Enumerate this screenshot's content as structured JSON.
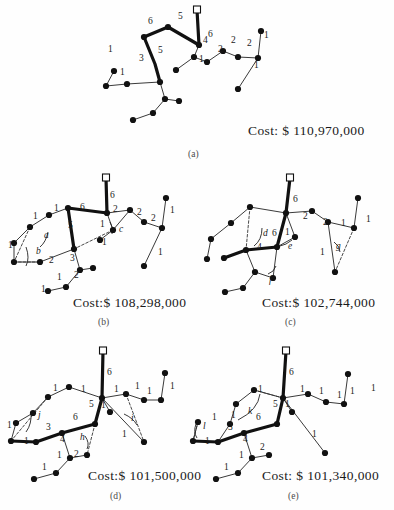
{
  "figure": {
    "panels": [
      {
        "id": "a",
        "caption": "(a)",
        "cost_label": "Cost: $ 110,970,000",
        "cost_value": 110970000,
        "cost_currency": "$",
        "cost_prefix": "Cost:",
        "root_marker": "square-terminal",
        "edge_labels": [
          "6",
          "5",
          "6",
          "5",
          "3",
          "1",
          "1",
          "4",
          "1",
          "2",
          "2",
          "2",
          "1",
          "1"
        ],
        "node_count": 20,
        "greek_labels": []
      },
      {
        "id": "b",
        "caption": "(b)",
        "cost_label": "Cost:$ 108,298,000",
        "cost_value": 108298000,
        "cost_currency": "$",
        "cost_prefix": "Cost:",
        "root_marker": "square-terminal",
        "edge_labels": [
          "6",
          "6",
          "1",
          "5",
          "1",
          "1",
          "2",
          "3",
          "1",
          "2",
          "1",
          "2",
          "1",
          "2",
          "2",
          "1",
          "1"
        ],
        "greek_labels": [
          "a",
          "b",
          "c"
        ]
      },
      {
        "id": "c",
        "caption": "(c)",
        "cost_label": "Cost:$ 102,744,000",
        "cost_value": 102744000,
        "cost_currency": "$",
        "cost_prefix": "Cost:",
        "root_marker": "square-terminal",
        "edge_labels": [
          "6",
          "2",
          "6",
          "1",
          "4",
          "2",
          "1",
          "1",
          "1"
        ],
        "greek_labels": [
          "d",
          "e",
          "f",
          "g"
        ]
      },
      {
        "id": "d",
        "caption": "(d)",
        "cost_label": "Cost:$ 101,500,000",
        "cost_value": 101500000,
        "cost_currency": "$",
        "cost_prefix": "Cost:",
        "root_marker": "square-terminal",
        "edge_labels": [
          "6",
          "1",
          "1",
          "1",
          "1",
          "1",
          "5",
          "1",
          "6",
          "3",
          "4",
          "2",
          "1",
          "1",
          "1",
          "1",
          "1"
        ],
        "greek_labels": [
          "h",
          "i",
          "j"
        ]
      },
      {
        "id": "e",
        "caption": "(e)",
        "cost_label": "Cost: $ 101,340,000",
        "cost_value": 101340000,
        "cost_currency": "$",
        "cost_prefix": "Cost:",
        "root_marker": "square-terminal",
        "edge_labels": [
          "6",
          "1",
          "1",
          "1",
          "1",
          "5",
          "1",
          "6",
          "1",
          "3",
          "1",
          "4",
          "2",
          "1",
          "1",
          "1"
        ],
        "greek_labels": [
          "k",
          "l"
        ]
      }
    ]
  },
  "panel_a": {
    "caption": "(a)",
    "cost": "Cost: $ 110,970,000",
    "labels": [
      {
        "t": "6",
        "x": 208,
        "y": 37
      },
      {
        "t": "5",
        "x": 178,
        "y": 19
      },
      {
        "t": "6",
        "x": 148,
        "y": 24
      },
      {
        "t": "5",
        "x": 158,
        "y": 53
      },
      {
        "t": "3",
        "x": 139,
        "y": 61
      },
      {
        "t": "1",
        "x": 108,
        "y": 52
      },
      {
        "t": "1",
        "x": 120,
        "y": 75
      },
      {
        "t": "4",
        "x": 203,
        "y": 43
      },
      {
        "t": "1",
        "x": 199,
        "y": 62
      },
      {
        "t": "2",
        "x": 218,
        "y": 52
      },
      {
        "t": "2",
        "x": 231,
        "y": 43
      },
      {
        "t": "2",
        "x": 247,
        "y": 46
      },
      {
        "t": "1",
        "x": 264,
        "y": 38
      },
      {
        "t": "1",
        "x": 254,
        "y": 68
      }
    ]
  },
  "panel_b": {
    "caption": "(b)",
    "cost": "Cost:$ 108,298,000",
    "labels": [
      {
        "t": "6",
        "x": 110,
        "y": 198
      },
      {
        "t": "6",
        "x": 80,
        "y": 210
      },
      {
        "t": "1",
        "x": 54,
        "y": 211
      },
      {
        "t": "1",
        "x": 33,
        "y": 219
      },
      {
        "t": "1",
        "x": 8,
        "y": 248
      },
      {
        "t": "5",
        "x": 68,
        "y": 228
      },
      {
        "t": "2",
        "x": 49,
        "y": 263
      },
      {
        "t": "3",
        "x": 70,
        "y": 261
      },
      {
        "t": "1",
        "x": 57,
        "y": 280
      },
      {
        "t": "2",
        "x": 74,
        "y": 278
      },
      {
        "t": "1",
        "x": 41,
        "y": 292
      },
      {
        "t": "2",
        "x": 113,
        "y": 212
      },
      {
        "t": "1",
        "x": 100,
        "y": 227
      },
      {
        "t": "1",
        "x": 102,
        "y": 245
      },
      {
        "t": "2",
        "x": 137,
        "y": 215
      },
      {
        "t": "2",
        "x": 151,
        "y": 221
      },
      {
        "t": "1",
        "x": 170,
        "y": 213
      },
      {
        "t": "1",
        "x": 158,
        "y": 255
      }
    ],
    "greek": [
      {
        "t": "a",
        "x": 44,
        "y": 238
      },
      {
        "t": "b",
        "x": 36,
        "y": 254
      },
      {
        "t": "c",
        "x": 119,
        "y": 232
      }
    ]
  },
  "panel_c": {
    "caption": "(c)",
    "cost": "Cost:$ 102,744,000",
    "labels": [
      {
        "t": "6",
        "x": 293,
        "y": 202
      },
      {
        "t": "2",
        "x": 303,
        "y": 219
      },
      {
        "t": "6",
        "x": 272,
        "y": 236
      },
      {
        "t": "1",
        "x": 285,
        "y": 235
      },
      {
        "t": "4",
        "x": 257,
        "y": 250
      },
      {
        "t": "2",
        "x": 323,
        "y": 225
      },
      {
        "t": "1",
        "x": 341,
        "y": 226
      },
      {
        "t": "1",
        "x": 366,
        "y": 222
      },
      {
        "t": "1",
        "x": 320,
        "y": 255
      }
    ],
    "greek": [
      {
        "t": "d",
        "x": 263,
        "y": 236
      },
      {
        "t": "e",
        "x": 288,
        "y": 249
      },
      {
        "t": "f",
        "x": 269,
        "y": 283
      },
      {
        "t": "g",
        "x": 336,
        "y": 249
      }
    ]
  },
  "panel_d": {
    "caption": "(d)",
    "cost": "Cost:$ 101,500,000",
    "labels": [
      {
        "t": "6",
        "x": 107,
        "y": 375
      },
      {
        "t": "1",
        "x": 81,
        "y": 392
      },
      {
        "t": "1",
        "x": 53,
        "y": 391
      },
      {
        "t": "1",
        "x": 114,
        "y": 392
      },
      {
        "t": "1",
        "x": 135,
        "y": 389
      },
      {
        "t": "1",
        "x": 147,
        "y": 394
      },
      {
        "t": "1",
        "x": 170,
        "y": 389
      },
      {
        "t": "5",
        "x": 89,
        "y": 407
      },
      {
        "t": "1",
        "x": 101,
        "y": 408
      },
      {
        "t": "6",
        "x": 73,
        "y": 420
      },
      {
        "t": "3",
        "x": 46,
        "y": 430
      },
      {
        "t": "1",
        "x": 7,
        "y": 428
      },
      {
        "t": "1",
        "x": 24,
        "y": 444
      },
      {
        "t": "4",
        "x": 60,
        "y": 442
      },
      {
        "t": "2",
        "x": 74,
        "y": 457
      },
      {
        "t": "1",
        "x": 57,
        "y": 458
      },
      {
        "t": "1",
        "x": 42,
        "y": 470
      },
      {
        "t": "1",
        "x": 122,
        "y": 437
      }
    ],
    "greek": [
      {
        "t": "h",
        "x": 80,
        "y": 440
      },
      {
        "t": "i",
        "x": 131,
        "y": 421
      },
      {
        "t": "j",
        "x": 38,
        "y": 418
      }
    ]
  },
  "panel_e": {
    "caption": "(e)",
    "cost": "Cost: $ 101,340,000",
    "labels": [
      {
        "t": "6",
        "x": 289,
        "y": 375
      },
      {
        "t": "1",
        "x": 258,
        "y": 392
      },
      {
        "t": "1",
        "x": 300,
        "y": 392
      },
      {
        "t": "1",
        "x": 319,
        "y": 394
      },
      {
        "t": "1",
        "x": 337,
        "y": 398
      },
      {
        "t": "1",
        "x": 350,
        "y": 394
      },
      {
        "t": "1",
        "x": 371,
        "y": 391
      },
      {
        "t": "5",
        "x": 273,
        "y": 407
      },
      {
        "t": "1",
        "x": 285,
        "y": 407
      },
      {
        "t": "6",
        "x": 256,
        "y": 420
      },
      {
        "t": "1",
        "x": 231,
        "y": 418
      },
      {
        "t": "3",
        "x": 228,
        "y": 430
      },
      {
        "t": "1",
        "x": 212,
        "y": 420
      },
      {
        "t": "1",
        "x": 205,
        "y": 444
      },
      {
        "t": "4",
        "x": 243,
        "y": 442
      },
      {
        "t": "2",
        "x": 260,
        "y": 450
      },
      {
        "t": "1",
        "x": 239,
        "y": 458
      },
      {
        "t": "1",
        "x": 224,
        "y": 470
      },
      {
        "t": "1",
        "x": 312,
        "y": 437
      }
    ],
    "greek": [
      {
        "t": "k",
        "x": 248,
        "y": 414
      },
      {
        "t": "l",
        "x": 203,
        "y": 429
      }
    ]
  },
  "colors": {
    "ink": "#111111",
    "thin_edge": "#3a3a3a",
    "paper": "#fefefe",
    "caption": "#4a4a4a"
  }
}
